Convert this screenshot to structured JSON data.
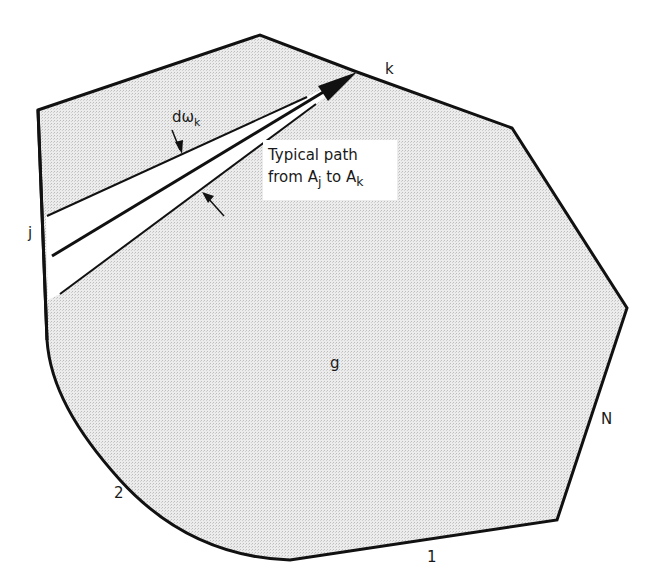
{
  "figure": {
    "type": "geometric diagram of enclosure with radiation path",
    "colors": {
      "fill": "#e4e4e4",
      "stroke": "#111111",
      "background": "#ffffff"
    },
    "labels": {
      "vertex_k": "k",
      "side_j": "j",
      "side_2": "2",
      "side_1": "1",
      "side_N": "N",
      "gas_region": "g",
      "solid_angle": "dω",
      "solid_angle_sub": "k"
    },
    "callout": {
      "line1": "Typical path",
      "line2_from": "from A",
      "line2_from_sub": "j",
      "line2_to": "to A",
      "line2_to_sub": "k"
    }
  }
}
